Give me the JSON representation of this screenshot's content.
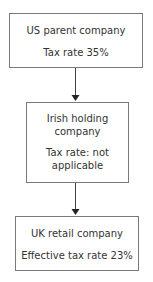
{
  "diagram": {
    "type": "ownership-flowchart",
    "nodes": [
      {
        "id": "us-parent",
        "title": "US parent company",
        "detail": "Tax rate 35%"
      },
      {
        "id": "irish-holding",
        "title_line1": "Irish holding",
        "title_line2": "company",
        "detail_line1": "Tax rate: not",
        "detail_line2": "applicable"
      },
      {
        "id": "uk-retail",
        "title": "UK retail company",
        "detail": "Effective tax rate 23%"
      }
    ],
    "edges": [
      {
        "from": "us-parent",
        "to": "irish-holding"
      },
      {
        "from": "irish-holding",
        "to": "uk-retail"
      }
    ],
    "colors": {
      "border": "#7a7a7a",
      "text": "#333333",
      "arrow": "#333333"
    }
  }
}
